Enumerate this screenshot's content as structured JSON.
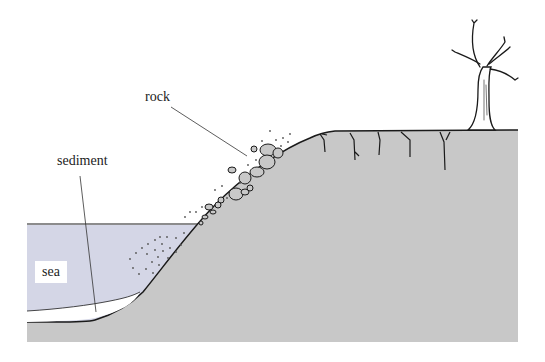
{
  "diagram": {
    "type": "coastal cliff cross-section",
    "labels": {
      "rock": "rock",
      "sediment": "sediment",
      "sea": "sea"
    },
    "colors": {
      "land": "#c8c8c8",
      "sea": "#d4d6e6",
      "sediment": "#ffffff",
      "outline": "#1a1a1a",
      "background": "#ffffff"
    },
    "elements": [
      "cliff",
      "sea",
      "sediment layer",
      "falling rocks",
      "cracks in cliff top",
      "dead tree"
    ]
  }
}
